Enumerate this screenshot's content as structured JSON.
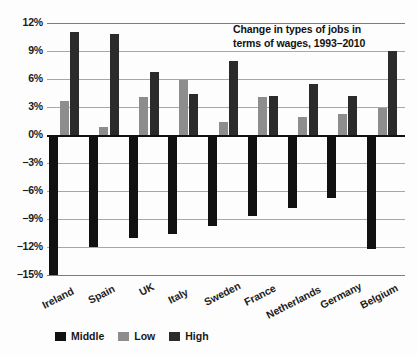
{
  "chart_data": {
    "type": "bar",
    "title": "Change in types of jobs in terms of wages, 1993–2010",
    "title_line1": "Change in types of jobs in",
    "title_line2": "terms of wages, 1993–2010",
    "xlabel": "",
    "ylabel": "",
    "ylim": [
      -15,
      12
    ],
    "grid": true,
    "legend_position": "bottom-left",
    "ytick_labels": [
      "12%",
      "9%",
      "6%",
      "3%",
      "0%",
      "−3%",
      "−6%",
      "−9%",
      "−12%",
      "−15%"
    ],
    "ytick_values": [
      12,
      9,
      6,
      3,
      0,
      -3,
      -6,
      -9,
      -12,
      -15
    ],
    "categories": [
      "Ireland",
      "Spain",
      "UK",
      "Italy",
      "Sweden",
      "France",
      "Netherlands",
      "Germany",
      "Belgium"
    ],
    "series": [
      {
        "name": "Middle",
        "color": "#111111",
        "values": [
          -15.0,
          -12.0,
          -11.0,
          -10.6,
          -9.7,
          -8.7,
          -7.8,
          -6.8,
          -12.2
        ]
      },
      {
        "name": "Low",
        "color": "#8d8d8d",
        "values": [
          3.6,
          0.9,
          4.1,
          5.9,
          1.4,
          4.1,
          1.9,
          2.2,
          2.9
        ]
      },
      {
        "name": "High",
        "color": "#2b2b2b",
        "values": [
          11.0,
          10.8,
          6.7,
          4.4,
          7.9,
          4.2,
          5.5,
          4.2,
          9.0
        ]
      }
    ]
  },
  "legend": {
    "items": [
      {
        "label": "Middle",
        "key": "middle"
      },
      {
        "label": "Low",
        "key": "low"
      },
      {
        "label": "High",
        "key": "high"
      }
    ]
  }
}
